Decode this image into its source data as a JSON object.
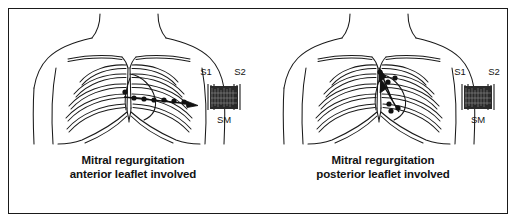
{
  "figure": {
    "background_color": "#ffffff",
    "ink_color": "#1a1a1a",
    "border_color": "#1a1a1a",
    "width": 517,
    "height": 223
  },
  "panels": [
    {
      "id": "anterior-leaflet",
      "diagram_name": "anterior-chest-torso-diagram",
      "caption_line1": "Mitral regurgitation",
      "caption_line2": "anterior leaflet involved",
      "radiation_direction": "to the axilla (horizontal, leftward chest to left axilla)",
      "murmur_marker_count": 7,
      "arrow_count": 1,
      "phonocardiogram": {
        "first_sound_label": "S1",
        "second_sound_label": "S2",
        "murmur_label": "SM",
        "murmur_shape": "pansystolic-plateau",
        "murmur_fill": "#2a2a2a"
      }
    },
    {
      "id": "posterior-leaflet",
      "diagram_name": "anterior-chest-torso-diagram",
      "caption_line1": "Mitral regurgitation",
      "caption_line2": "posterior leaflet involved",
      "radiation_direction": "to the base (upward and medially toward aortic area)",
      "murmur_marker_count": 6,
      "arrow_count": 2,
      "phonocardiogram": {
        "first_sound_label": "S1",
        "second_sound_label": "S2",
        "murmur_label": "SM",
        "murmur_shape": "pansystolic-plateau",
        "murmur_fill": "#2a2a2a"
      }
    }
  ]
}
